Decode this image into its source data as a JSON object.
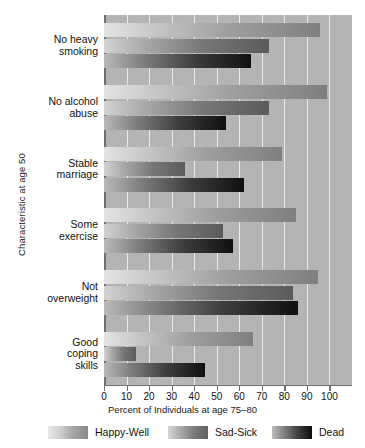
{
  "chart_data": {
    "type": "bar",
    "orientation": "horizontal",
    "title": "",
    "xlabel": "Percent of Individuals at age 75–80",
    "ylabel": "Characteristic at age 50",
    "categories": [
      "No heavy smoking",
      "No alcohol abuse",
      "Stable marriage",
      "Some exercise",
      "Not overweight",
      "Good coping skills"
    ],
    "category_lines": [
      [
        "No heavy",
        "smoking"
      ],
      [
        "No alcohol",
        "abuse"
      ],
      [
        "Stable",
        "marriage"
      ],
      [
        "Some",
        "exercise"
      ],
      [
        "Not",
        "overweight"
      ],
      [
        "Good",
        "coping",
        "skills"
      ]
    ],
    "series": [
      {
        "name": "Happy-Well",
        "values": [
          96,
          99,
          79,
          85,
          95,
          66
        ]
      },
      {
        "name": "Sad-Sick",
        "values": [
          73,
          73,
          36,
          53,
          84,
          14
        ]
      },
      {
        "name": "Dead",
        "values": [
          65,
          54,
          62,
          57,
          86,
          45
        ]
      }
    ],
    "xlim": [
      0,
      110
    ],
    "xticks": [
      0,
      10,
      20,
      30,
      40,
      50,
      60,
      70,
      80,
      90,
      100
    ],
    "xtick_labels": [
      "0",
      "10",
      "20",
      "30",
      "40",
      "50",
      "60",
      "70",
      "80",
      "90",
      "100"
    ],
    "grid": "vertical-white-gridlines",
    "legend_position": "bottom",
    "plot_background": "#b4b4b4",
    "gridline_color": "#eceaea",
    "axis_color": "#6e6e6e",
    "bar_style": "grayscale-gradient-light-to-dark"
  }
}
